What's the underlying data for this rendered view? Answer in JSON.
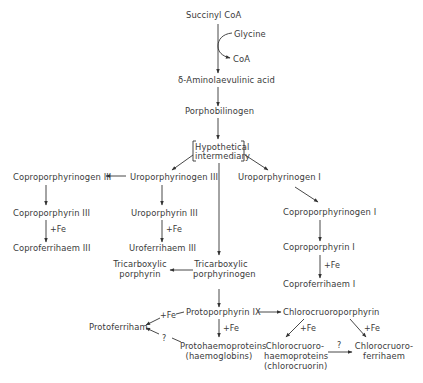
{
  "diagram": {
    "type": "biosynthetic pathway",
    "nodes": {
      "succinyl_coa": "Succinyl CoA",
      "glycine": "Glycine",
      "coa": "CoA",
      "ala": "δ-Aminolaevulinic acid",
      "porphobilinogen": "Porphobilinogen",
      "hypothetical_1": "Hypothetical",
      "hypothetical_2": "intermediary",
      "uroporphyrinogen_iii": "Uroporphyrinogen III",
      "coproporphyrinogen_iii": "Coproporphyrinogen III",
      "coproporphyrin_iii": "Coproporphyrin III",
      "coproferrihaem_iii": "Coproferrihaem III",
      "uroporphyrin_iii": "Uroporphyrin III",
      "uroferrihaem_iii": "Uroferrihaem III",
      "uroporphyrinogen_i": "Uroporphyrinogen I",
      "coproporphyrinogen_i": "Coproporphyrinogen I",
      "coproporphyrin_i": "Coproporphyrin I",
      "coproferrihaem_i": "Coproferrihaem I",
      "tricarboxylic_porphyrin_1": "Tricarboxylic",
      "tricarboxylic_porphyrin_2": "porphyrin",
      "tricarboxylic_porphyrinogen_1": "Tricarboxylic",
      "tricarboxylic_porphyrinogen_2": "porphyrinogen",
      "protoporphyrin_ix": "Protoporphyrin IX",
      "protoferriham": "Protoferriham",
      "protohaemoproteins_1": "Protohaemoproteins",
      "protohaemoproteins_2": "(haemoglobins)",
      "chlorocruoroporphyrin": "Chlorocruoroporphyrin",
      "chlorocruorohaemoproteins_1": "Chlorocruoro-",
      "chlorocruorohaemoproteins_2": "haemoproteins",
      "chlorocruorohaemoproteins_3": "(chlorocruorin)",
      "chlorocruoroferrihaem_1": "Chlorocruoro-",
      "chlorocruoroferrihaem_2": "ferrihaem"
    },
    "edge_labels": {
      "fe_copro_iii": "+Fe",
      "fe_uro_iii": "+Fe",
      "fe_copro_i": "+Fe",
      "fe_protoferriham": "+Fe",
      "unknown_protoferriham": "?",
      "fe_protohaemo": "+Fe",
      "fe_chloro_haemo": "+Fe",
      "fe_chloro_ferri": "+Fe",
      "unknown_chloro": "?"
    }
  }
}
